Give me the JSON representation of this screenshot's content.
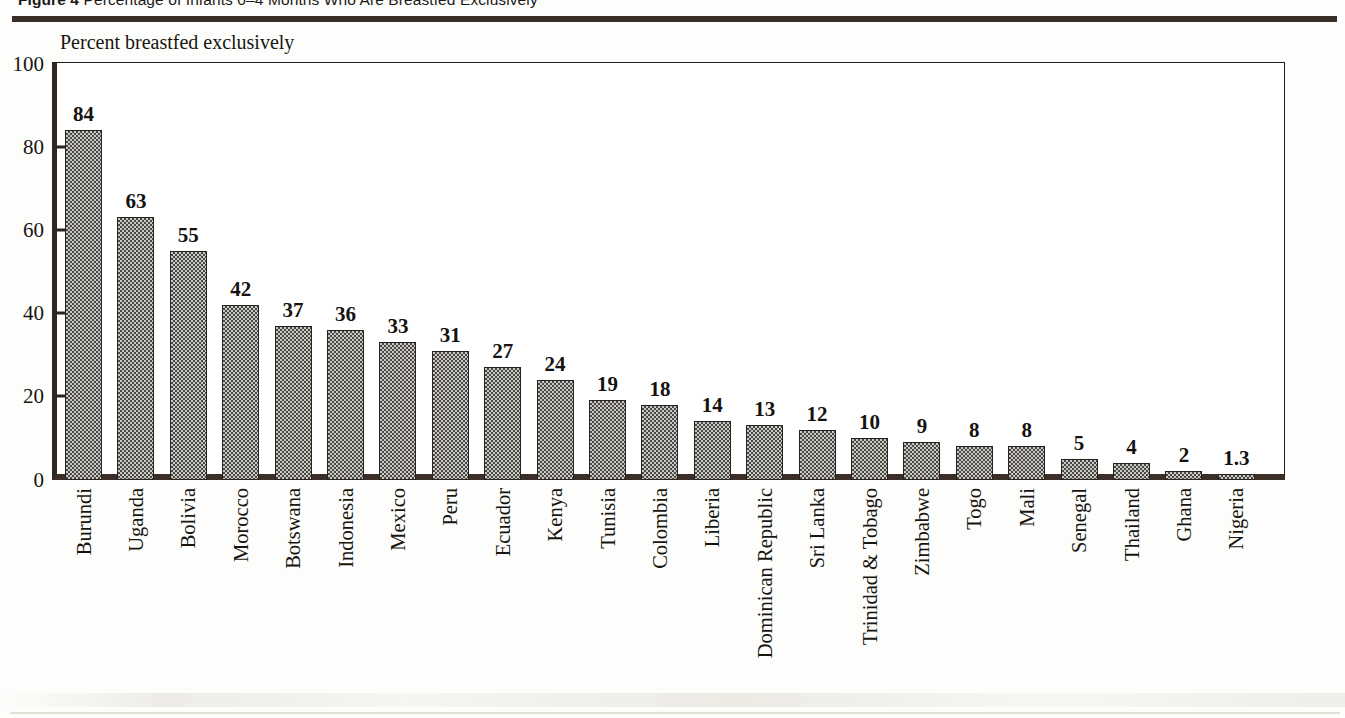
{
  "figure": {
    "caption_prefix": "Figure 4",
    "caption_text": "Percentage of Infants 0–4 Months Who Are Breastfed Exclusively",
    "caption_full": "Figure 4  Percentage of Infants 0–4 Months Who Are Breastfed Exclusively"
  },
  "chart_data": {
    "type": "bar",
    "title": "Percentage of Infants 0–4 Months Who Are Breastfed Exclusively",
    "subtitle": "",
    "xlabel": "",
    "ylabel": "Percent breastfed exclusively",
    "axis_note": "Percent breastfed exclusively",
    "ylim": [
      0,
      100
    ],
    "yticks": [
      0,
      20,
      40,
      60,
      80,
      100
    ],
    "ytick_labels": [
      "0",
      "20",
      "40",
      "60",
      "80",
      "100"
    ],
    "grid": false,
    "legend": false,
    "legend_position": "none",
    "bar_labels_shown": true,
    "categories": [
      "Burundi",
      "Uganda",
      "Bolivia",
      "Morocco",
      "Botswana",
      "Indonesia",
      "Mexico",
      "Peru",
      "Ecuador",
      "Kenya",
      "Tunisia",
      "Colombia",
      "Liberia",
      "Dominican Republic",
      "Sri Lanka",
      "Trinidad & Tobago",
      "Zimbabwe",
      "Togo",
      "Mali",
      "Senegal",
      "Thailand",
      "Ghana",
      "Nigeria"
    ],
    "values": [
      84,
      63,
      55,
      42,
      37,
      36,
      33,
      31,
      27,
      24,
      19,
      18,
      14,
      13,
      12,
      10,
      9,
      8,
      8,
      5,
      4,
      2,
      1.3
    ],
    "value_labels": [
      "84",
      "63",
      "55",
      "42",
      "37",
      "36",
      "33",
      "31",
      "27",
      "24",
      "19",
      "18",
      "14",
      "13",
      "12",
      "10",
      "9",
      "8",
      "8",
      "5",
      "4",
      "2",
      "1.3"
    ]
  },
  "colors": {
    "bar_fill_light": "#c9c9c4",
    "bar_fill_dark": "#4a4744",
    "bar_outline": "#262220",
    "axis": "#3b2f27",
    "rule": "#3a2f28",
    "text": "#17150f",
    "page_background": "#fdfdfb",
    "plot_background": "#ffffff"
  }
}
